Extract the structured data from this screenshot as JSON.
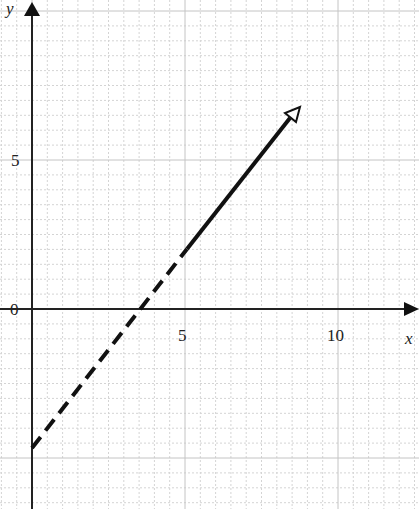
{
  "chart_data": {
    "type": "line",
    "title": "",
    "xlabel": "x",
    "ylabel": "y",
    "origin_label": "0",
    "x_ticks": [
      {
        "value": 5,
        "label": "5"
      },
      {
        "value": 10,
        "label": "10"
      }
    ],
    "y_ticks": [
      {
        "value": 5,
        "label": "5"
      }
    ],
    "xlim": [
      -1,
      12.5
    ],
    "ylim": [
      -6.5,
      10
    ],
    "grid": true,
    "grid_minor_step": 0.5,
    "series": [
      {
        "name": "dashed segment",
        "style": "dashed",
        "points": [
          {
            "x": 0,
            "y": -4.6
          },
          {
            "x": 5,
            "y": 2
          }
        ]
      },
      {
        "name": "solid ray",
        "style": "solid",
        "arrow": "open-head",
        "points": [
          {
            "x": 5,
            "y": 2
          },
          {
            "x": 8.7,
            "y": 6.6
          }
        ]
      }
    ],
    "annotations": [
      {
        "text": "x-intercept",
        "x": 3.5,
        "y": 0
      },
      {
        "text": "y-intercept",
        "x": 0,
        "y": -4.6
      }
    ]
  },
  "labels": {
    "x_axis": "x",
    "y_axis": "y",
    "origin": "0",
    "tick_x5": "5",
    "tick_x10": "10",
    "tick_y5": "5"
  }
}
